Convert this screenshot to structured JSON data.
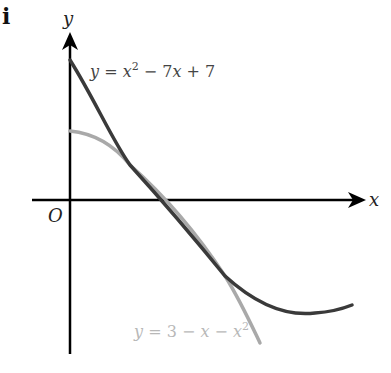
{
  "figure": {
    "part_label": "i",
    "axes": {
      "x_label": "x",
      "y_label": "y",
      "origin_label": "O"
    },
    "curves": [
      {
        "name": "quadratic-dark",
        "equation": {
          "y": "y",
          "eq": " = ",
          "x": "x",
          "sup": "2",
          "rest": " − 7",
          "x2": "x",
          "tail": " + 7"
        },
        "color": "#3a3a3a"
      },
      {
        "name": "quadratic-light",
        "equation": {
          "y": "y",
          "eq": " = 3 − ",
          "x": "x",
          "mid": " − ",
          "x2": "x",
          "sup": "2"
        },
        "color": "#a9a9a9"
      }
    ],
    "shaded_region_color": "#e6e6e6"
  }
}
